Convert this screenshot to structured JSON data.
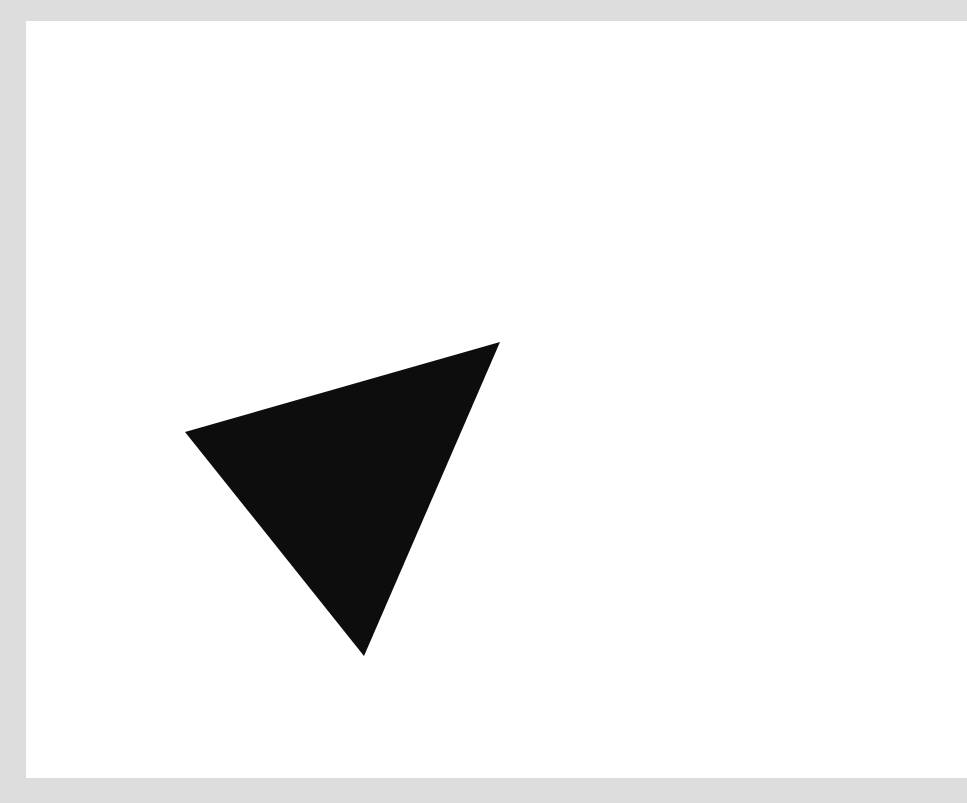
{
  "image": {
    "title": "Black Triangle on White Field",
    "width": 967,
    "height": 803,
    "background_color": "#dddddd",
    "paper_color": "#ffffff",
    "paper": {
      "x": 26,
      "y": 21,
      "width": 941,
      "height": 757
    }
  },
  "chart_data": {
    "type": "scatter",
    "xlabel": "",
    "ylabel": "",
    "grid": false,
    "legend": false,
    "xlim": [
      0,
      967
    ],
    "ylim": [
      0,
      803
    ],
    "shapes": [
      {
        "name": "triangle",
        "kind": "polygon",
        "fill": "#0d0d0d",
        "stroke": "none",
        "vertices": [
          {
            "label": "left-vertex",
            "x": 185,
            "y": 432
          },
          {
            "label": "right-vertex",
            "x": 500,
            "y": 342
          },
          {
            "label": "bottom-vertex",
            "x": 364,
            "y": 656
          }
        ],
        "orientation": "point-down",
        "classification": "scalene"
      }
    ]
  },
  "shape": {
    "fill_color": "#0d0d0d",
    "points_attr": "185,432 500,342 364,656",
    "vertex_labels": {
      "left": "left-vertex",
      "right": "right-vertex",
      "bottom": "bottom-vertex"
    }
  }
}
